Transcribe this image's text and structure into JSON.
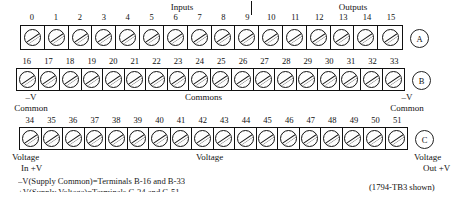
{
  "diagram": {
    "caption": "(1794-TB3 shown)",
    "section_labels": {
      "inputs": "Inputs",
      "outputs": "Outputs"
    },
    "footnotes": [
      "–V(Supply Common)=Terminals B-16 and B-33",
      "+V(Supply Voltage)=Terminals C-34 and C-51"
    ],
    "rows": [
      {
        "id": "row-a",
        "badge": "A",
        "terminals": [
          0,
          1,
          2,
          3,
          4,
          5,
          6,
          7,
          8,
          9,
          10,
          11,
          12,
          13,
          14,
          15
        ],
        "labels": []
      },
      {
        "id": "row-b",
        "badge": "B",
        "terminals": [
          16,
          17,
          18,
          19,
          20,
          21,
          22,
          23,
          24,
          25,
          26,
          27,
          28,
          29,
          30,
          31,
          32,
          33
        ],
        "labels": [
          {
            "name": "left",
            "line1": "–V",
            "line2": "Common"
          },
          {
            "name": "center",
            "line1": "Commons",
            "line2": ""
          },
          {
            "name": "right",
            "line1": "–V",
            "line2": "Common"
          }
        ]
      },
      {
        "id": "row-c",
        "badge": "C",
        "terminals": [
          34,
          35,
          36,
          37,
          38,
          39,
          40,
          41,
          42,
          43,
          44,
          45,
          46,
          47,
          48,
          49,
          50,
          51
        ],
        "labels": [
          {
            "name": "left",
            "line1": "Voltage",
            "line2": "In +V"
          },
          {
            "name": "center",
            "line1": "Voltage",
            "line2": ""
          },
          {
            "name": "right",
            "line1": "Voltage",
            "line2": "Out +V"
          }
        ]
      }
    ],
    "colors": {
      "ink": "#111111",
      "paper": "#ffffff"
    }
  }
}
